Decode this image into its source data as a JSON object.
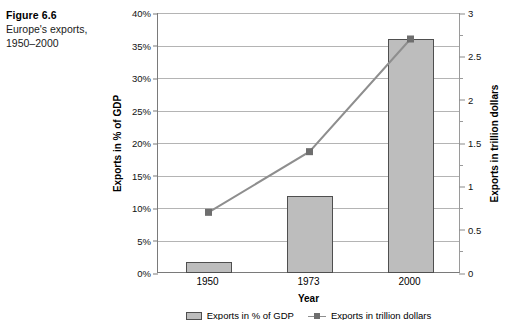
{
  "caption": {
    "figure_number": "Figure 6.6",
    "description_line1": "Europe's exports,",
    "description_line2": "1950–2000"
  },
  "chart_data": {
    "type": "bar",
    "title": "Europe's exports, 1950–2000",
    "categories": [
      "1950",
      "1973",
      "2000"
    ],
    "xlabel": "Year",
    "ylabel": "Exports in % of GDP",
    "y2label": "Exports in trillion dollars",
    "ylim": [
      0,
      40
    ],
    "y2lim": [
      0,
      3
    ],
    "grid": true,
    "legend_position": "bottom",
    "y_ticklabels": [
      "0%",
      "5%",
      "10%",
      "15%",
      "20%",
      "25%",
      "30%",
      "35%",
      "40%"
    ],
    "y_tickvalues": [
      0,
      5,
      10,
      15,
      20,
      25,
      30,
      35,
      40
    ],
    "y2_ticklabels": [
      "0",
      "0.5",
      "1",
      "1.5",
      "2",
      "2.5",
      "3"
    ],
    "y2_tickvalues": [
      0,
      0.5,
      1,
      1.5,
      2,
      2.5,
      3
    ],
    "y2_minor_tickvalues": [
      0.25,
      0.75,
      1.25,
      1.75,
      2.25,
      2.75
    ],
    "series": [
      {
        "name": "Exports in % of GDP",
        "type": "bar",
        "axis": "left",
        "values": [
          1.7,
          11.8,
          36.0
        ],
        "color": "#bdbdbd",
        "edge_color": "#4f4f4f"
      },
      {
        "name": "Exports in trillion dollars",
        "type": "line",
        "axis": "right",
        "values": [
          0.7,
          1.4,
          2.7
        ],
        "color": "#8e8e8e",
        "marker_color": "#6e6e6e"
      }
    ]
  },
  "legend": {
    "entries": [
      {
        "label": "Exports in % of GDP",
        "swatch": "bar"
      },
      {
        "label": "Exports in trillion dollars",
        "swatch": "line"
      }
    ]
  }
}
